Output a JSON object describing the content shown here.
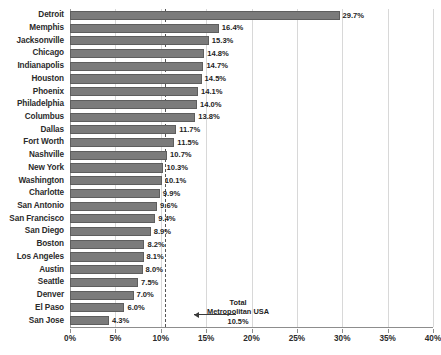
{
  "chart_data": {
    "type": "bar",
    "orientation": "horizontal",
    "title": "",
    "subtitle": "",
    "xlabel": "",
    "ylabel": "",
    "xlim": [
      0,
      40
    ],
    "xtick_labels": [
      "0%",
      "5%",
      "10%",
      "15%",
      "20%",
      "25%",
      "30%",
      "35%",
      "40%"
    ],
    "xtick_values": [
      0,
      5,
      10,
      15,
      20,
      25,
      30,
      35,
      40
    ],
    "grid": true,
    "legend": "none",
    "categories": [
      "Detroit",
      "Memphis",
      "Jacksonville",
      "Chicago",
      "Indianapolis",
      "Houston",
      "Phoenix",
      "Philadelphia",
      "Columbus",
      "Dallas",
      "Fort Worth",
      "Nashville",
      "New York",
      "Washington",
      "Charlotte",
      "San  Antonio",
      "San Francisco",
      "San Diego",
      "Boston",
      "Los Angeles",
      "Austin",
      "Seattle",
      "Denver",
      "El Paso",
      "San Jose"
    ],
    "values": [
      29.7,
      16.4,
      15.3,
      14.8,
      14.7,
      14.5,
      14.1,
      14.0,
      13.8,
      11.7,
      11.5,
      10.7,
      10.3,
      10.1,
      9.9,
      9.6,
      9.4,
      8.9,
      8.2,
      8.1,
      8.0,
      7.5,
      7.0,
      6.0,
      4.3
    ],
    "value_labels": [
      "29.7%",
      "16.4%",
      "15.3%",
      "14.8%",
      "14.7%",
      "14.5%",
      "14.1%",
      "14.0%",
      "13.8%",
      "11.7%",
      "11.5%",
      "10.7%",
      "10.3%",
      "10.1%",
      "9.9%",
      "9.6%",
      "9.4%",
      "8.9%",
      "8.2%",
      "8.1%",
      "8.0%",
      "7.5%",
      "7.0%",
      "6.0%",
      "4.3%"
    ],
    "reference_line": {
      "value": 10.5,
      "style": "dashed",
      "label_line1": "Total",
      "label_line2": "Metropolitan USA",
      "label_line3": "10.5%"
    },
    "colors": {
      "bar_fill": "#7b7b7b",
      "bar_edge": "#5e5e5e",
      "gridline": "#d8d8d8",
      "axis": "#8d8d8d",
      "reference_line": "#555555",
      "text": "#2b2b2b",
      "background": "#ffffff"
    }
  }
}
